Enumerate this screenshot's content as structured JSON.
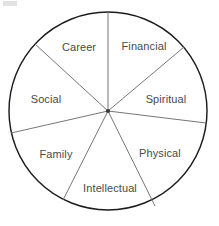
{
  "diagram": {
    "shape": "circle-divided-into-seven-sectors",
    "center": {
      "x": 108,
      "y": 111
    },
    "radius": 99,
    "outline_color": "#1d1d1d",
    "spoke_color": "#6f6f6f",
    "label_color": "#4a4a4a",
    "background_color": "#ffffff",
    "sectors": [
      {
        "label": "Financial",
        "label_x": 144,
        "label_y": 46,
        "start_angle": 40,
        "end_angle": 90
      },
      {
        "label": "Spiritual",
        "label_x": 166,
        "label_y": 99,
        "start_angle": -7,
        "end_angle": 40
      },
      {
        "label": "Physical",
        "label_x": 160,
        "label_y": 153,
        "start_angle": -62,
        "end_angle": -7
      },
      {
        "label": "Intellectual",
        "label_x": 110,
        "label_y": 188,
        "start_angle": -116,
        "end_angle": -62
      },
      {
        "label": "Family",
        "label_x": 56,
        "label_y": 154,
        "start_angle": -167,
        "end_angle": -116
      },
      {
        "label": "Social",
        "label_x": 46,
        "label_y": 99,
        "start_angle": 137,
        "end_angle": 193
      },
      {
        "label": "Career",
        "label_x": 79,
        "label_y": 47,
        "start_angle": 90,
        "end_angle": 137
      }
    ],
    "spoke_endpoints": [
      {
        "name": "spoke-top",
        "x": 108,
        "y": 12
      },
      {
        "name": "spoke-financial-spiritual",
        "x": 184,
        "y": 47
      },
      {
        "name": "spoke-spiritual-physical",
        "x": 206,
        "y": 123
      },
      {
        "name": "spoke-physical-intellectual",
        "x": 155,
        "y": 206
      },
      {
        "name": "spoke-intellectual-family",
        "x": 63,
        "y": 200
      },
      {
        "name": "spoke-family-social",
        "x": 11,
        "y": 133
      },
      {
        "name": "spoke-social-career",
        "x": 35,
        "y": 44
      }
    ]
  }
}
